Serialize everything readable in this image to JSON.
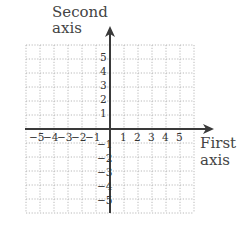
{
  "diagram": {
    "type": "cartesian-coordinate-plane",
    "x_axis": {
      "title_line1": "First",
      "title_line2": "axis",
      "ticks": [
        "−5",
        "−4",
        "−3",
        "−2",
        "−1",
        "1",
        "2",
        "3",
        "4",
        "5"
      ],
      "range": [
        -6,
        6
      ]
    },
    "y_axis": {
      "title_line1": "Second",
      "title_line2": "axis",
      "ticks": [
        "5",
        "4",
        "3",
        "2",
        "1",
        "−1",
        "−2",
        "−3",
        "−4",
        "−5"
      ],
      "range": [
        -6,
        6
      ]
    },
    "grid": {
      "style": "dotted",
      "cells_per_side": 6
    },
    "colors": {
      "axis": "#3a3a3a",
      "grid": "#b8b8b8",
      "text": "#3a3a3a"
    }
  }
}
